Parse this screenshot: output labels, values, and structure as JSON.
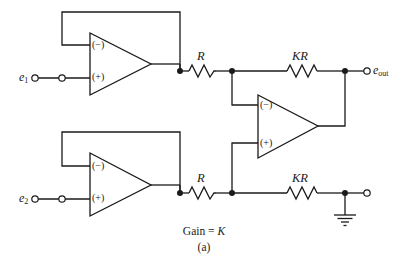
{
  "figure": {
    "type": "circuit-schematic",
    "caption_line1_prefix": "Gain = ",
    "caption_line1_symbol": "K",
    "caption_line2": "(a)",
    "stroke_color": "#1a1a1a",
    "background_color": "#ffffff"
  },
  "terminals": {
    "input1_label": "e",
    "input1_subscript": "1",
    "input2_label": "e",
    "input2_subscript": "2",
    "output_label": "e",
    "output_subscript": "out"
  },
  "opamps": [
    {
      "id": "opamp-top",
      "minus_label": "(−)",
      "plus_label": "(+)",
      "role": "buffer-input-1"
    },
    {
      "id": "opamp-middle",
      "minus_label": "(−)",
      "plus_label": "(+)",
      "role": "difference-amplifier"
    },
    {
      "id": "opamp-bottom",
      "minus_label": "(−)",
      "plus_label": "(+)",
      "role": "buffer-input-2"
    }
  ],
  "resistors": [
    {
      "id": "resistor-top-r",
      "label": "R",
      "branch": "opamp-top-output to opamp-middle-minus"
    },
    {
      "id": "resistor-top-kr",
      "label": "KR",
      "branch": "opamp-middle-minus to output-node"
    },
    {
      "id": "resistor-bot-r",
      "label": "R",
      "branch": "opamp-bottom-output to opamp-middle-plus"
    },
    {
      "id": "resistor-bot-kr",
      "label": "KR",
      "branch": "opamp-middle-plus to ground-node"
    }
  ],
  "ground": {
    "id": "ground-symbol",
    "label": ""
  }
}
